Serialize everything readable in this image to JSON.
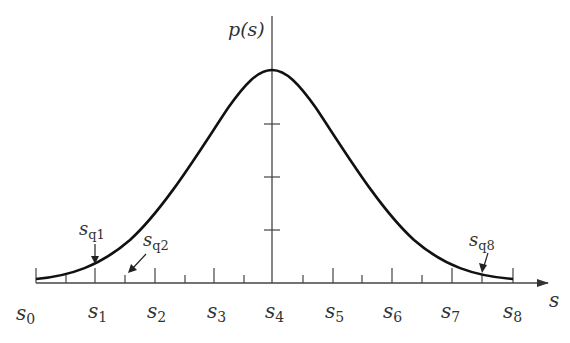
{
  "diagram": {
    "type": "probability density curve with quantization levels",
    "y_axis_label": "p(s)",
    "x_axis_label": "s",
    "x_tick_labels": [
      {
        "base": "s",
        "sub": "0"
      },
      {
        "base": "s",
        "sub": "1"
      },
      {
        "base": "s",
        "sub": "2"
      },
      {
        "base": "s",
        "sub": "3"
      },
      {
        "base": "s",
        "sub": "4"
      },
      {
        "base": "s",
        "sub": "5"
      },
      {
        "base": "s",
        "sub": "6"
      },
      {
        "base": "s",
        "sub": "7"
      },
      {
        "base": "s",
        "sub": "8"
      }
    ],
    "annotations": [
      {
        "base": "s",
        "sub": "q1",
        "points_to": "curve near s1"
      },
      {
        "base": "s",
        "sub": "q2",
        "points_to": "minor tick between s1 and s2"
      },
      {
        "base": "s",
        "sub": "q8",
        "points_to": "curve near midpoint of s7 and s8"
      }
    ],
    "y_axis_tick_count": 3,
    "colors": {
      "curve": "#111111",
      "axes": "#444444",
      "text": "#333333",
      "background": "#ffffff"
    }
  }
}
